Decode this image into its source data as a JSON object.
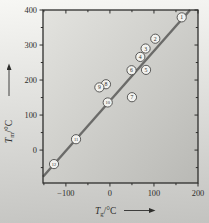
{
  "chart_data": {
    "type": "scatter",
    "title": "",
    "xlabel": {
      "symbol": "T",
      "subscript": "g",
      "unit": "/°C"
    },
    "ylabel": {
      "symbol": "T",
      "subscript": "m",
      "unit": "/°C"
    },
    "xlim": [
      -152,
      200
    ],
    "ylim": [
      -94,
      400
    ],
    "x_major_ticks": [
      -100,
      0,
      100,
      200
    ],
    "x_minor_ticks": [
      -150,
      -50,
      50,
      150
    ],
    "y_major_ticks": [
      0,
      100,
      200,
      300,
      400
    ],
    "y_minor_ticks": [
      -50,
      50,
      150,
      250,
      350
    ],
    "grid": false,
    "legend": "none",
    "points": [
      {
        "label": "1",
        "x": 163,
        "y": 379
      },
      {
        "label": "2",
        "x": 103,
        "y": 318
      },
      {
        "label": "3",
        "x": 81,
        "y": 290
      },
      {
        "label": "4",
        "x": 69,
        "y": 266
      },
      {
        "label": "5",
        "x": 82,
        "y": 229
      },
      {
        "label": "6",
        "x": 49,
        "y": 228
      },
      {
        "label": "7",
        "x": 50,
        "y": 151
      },
      {
        "label": "8",
        "x": -9,
        "y": 188
      },
      {
        "label": "9",
        "x": -24,
        "y": 179
      },
      {
        "label": "10",
        "x": -5,
        "y": 136
      },
      {
        "label": "11",
        "x": -77,
        "y": 31
      },
      {
        "label": "12",
        "x": -127,
        "y": -40
      }
    ],
    "trend_line": {
      "x1": -152,
      "y1": -76,
      "x2": 182,
      "y2": 400
    },
    "colors": {
      "frame": "#2f2f2d",
      "line": "#6b6b69",
      "point_fill": "#f2f2ef",
      "point_stroke": "#4a4a48",
      "text": "#2e2e2c",
      "plot_bg_light": "#e3e3df",
      "plot_bg_dark": "#b9b9b5",
      "page_bg_light": "#f7f7f4",
      "page_bg_dark": "#c3c3c0"
    }
  }
}
